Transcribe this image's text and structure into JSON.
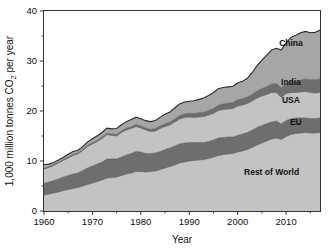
{
  "chart_data": {
    "type": "area",
    "stacked": true,
    "title": "",
    "subtitle": "",
    "xlabel": "Year",
    "ylabel": "1,000 million tonnes CO₂ per year",
    "xlim": [
      1960,
      2017
    ],
    "ylim": [
      0,
      40
    ],
    "xticks": [
      1960,
      1970,
      1980,
      1990,
      2000,
      2010
    ],
    "xtick_labels": [
      "1960",
      "1970",
      "1980",
      "1990",
      "2000",
      "2010"
    ],
    "xminor_ticks": [
      1965,
      1975,
      1985,
      1995,
      2005,
      2015
    ],
    "yticks": [
      0,
      10,
      20,
      30,
      40
    ],
    "ytick_labels": [
      "0",
      "10",
      "20",
      "30",
      "40"
    ],
    "yminor_ticks": [
      5,
      15,
      25,
      35
    ],
    "grid": false,
    "legend_position": "inline-right",
    "x": [
      1960,
      1961,
      1962,
      1963,
      1964,
      1965,
      1966,
      1967,
      1968,
      1969,
      1970,
      1971,
      1972,
      1973,
      1974,
      1975,
      1976,
      1977,
      1978,
      1979,
      1980,
      1981,
      1982,
      1983,
      1984,
      1985,
      1986,
      1987,
      1988,
      1989,
      1990,
      1991,
      1992,
      1993,
      1994,
      1995,
      1996,
      1997,
      1998,
      1999,
      2000,
      2001,
      2002,
      2003,
      2004,
      2005,
      2006,
      2007,
      2008,
      2009,
      2010,
      2011,
      2012,
      2013,
      2014,
      2015,
      2016,
      2017
    ],
    "series": [
      {
        "name": "Rest of World",
        "color": "#c3c3c3",
        "label_color": "#1a1a1a",
        "values": [
          3.2,
          3.4,
          3.6,
          3.8,
          4.1,
          4.3,
          4.5,
          4.7,
          5.0,
          5.3,
          5.6,
          5.9,
          6.2,
          6.6,
          6.7,
          6.8,
          7.1,
          7.4,
          7.6,
          7.9,
          7.9,
          7.8,
          7.9,
          8.0,
          8.3,
          8.6,
          8.9,
          9.2,
          9.6,
          9.8,
          10.0,
          10.1,
          10.2,
          10.3,
          10.5,
          10.8,
          11.1,
          11.3,
          11.4,
          11.5,
          11.8,
          12.0,
          12.3,
          12.7,
          13.2,
          13.6,
          14.0,
          14.4,
          14.6,
          14.3,
          14.9,
          15.3,
          15.5,
          15.6,
          15.7,
          15.6,
          15.6,
          15.7
        ]
      },
      {
        "name": "EU",
        "color": "#6e6e6e",
        "label_color": "#111111",
        "values": [
          2.3,
          2.4,
          2.5,
          2.6,
          2.7,
          2.8,
          2.9,
          2.9,
          3.1,
          3.3,
          3.4,
          3.5,
          3.6,
          3.8,
          3.7,
          3.6,
          3.7,
          3.8,
          3.9,
          4.0,
          3.9,
          3.7,
          3.6,
          3.6,
          3.6,
          3.7,
          3.7,
          3.8,
          3.8,
          3.8,
          3.7,
          3.6,
          3.5,
          3.4,
          3.4,
          3.4,
          3.5,
          3.4,
          3.4,
          3.3,
          3.3,
          3.4,
          3.4,
          3.5,
          3.5,
          3.5,
          3.5,
          3.4,
          3.4,
          3.1,
          3.2,
          3.1,
          3.1,
          3.0,
          2.9,
          2.9,
          2.9,
          2.9
        ]
      },
      {
        "name": "USA",
        "color": "#c3c3c3",
        "label_color": "#1a1a1a",
        "values": [
          2.9,
          2.9,
          3.0,
          3.2,
          3.3,
          3.5,
          3.7,
          3.8,
          4.0,
          4.3,
          4.4,
          4.5,
          4.7,
          4.9,
          4.7,
          4.6,
          4.9,
          5.0,
          5.0,
          5.0,
          4.8,
          4.7,
          4.4,
          4.4,
          4.6,
          4.6,
          4.6,
          4.8,
          5.0,
          5.1,
          5.1,
          5.0,
          5.1,
          5.2,
          5.3,
          5.3,
          5.5,
          5.6,
          5.6,
          5.7,
          5.9,
          5.8,
          5.8,
          5.8,
          5.9,
          5.9,
          5.8,
          5.9,
          5.7,
          5.3,
          5.4,
          5.3,
          5.1,
          5.2,
          5.3,
          5.2,
          5.1,
          5.1
        ]
      },
      {
        "name": "India",
        "color": "#6e6e6e",
        "label_color": "#111111",
        "values": [
          0.12,
          0.13,
          0.15,
          0.16,
          0.17,
          0.18,
          0.19,
          0.2,
          0.21,
          0.22,
          0.23,
          0.24,
          0.26,
          0.27,
          0.28,
          0.3,
          0.32,
          0.34,
          0.35,
          0.37,
          0.38,
          0.41,
          0.43,
          0.46,
          0.49,
          0.53,
          0.57,
          0.61,
          0.66,
          0.7,
          0.74,
          0.79,
          0.84,
          0.87,
          0.92,
          0.99,
          1.05,
          1.1,
          1.14,
          1.2,
          1.23,
          1.25,
          1.29,
          1.33,
          1.41,
          1.48,
          1.57,
          1.69,
          1.8,
          1.94,
          2.01,
          2.13,
          2.27,
          2.34,
          2.52,
          2.56,
          2.62,
          2.7
        ]
      },
      {
        "name": "China",
        "color": "#a6a6a6",
        "label_color": "#1a1a1a",
        "values": [
          0.78,
          0.55,
          0.44,
          0.46,
          0.5,
          0.55,
          0.62,
          0.54,
          0.57,
          0.7,
          0.82,
          0.9,
          0.95,
          1.0,
          1.05,
          1.2,
          1.22,
          1.33,
          1.46,
          1.5,
          1.48,
          1.46,
          1.55,
          1.65,
          1.78,
          1.93,
          2.03,
          2.18,
          2.33,
          2.4,
          2.42,
          2.55,
          2.68,
          2.83,
          2.99,
          3.2,
          3.32,
          3.3,
          3.28,
          3.25,
          3.35,
          3.48,
          3.76,
          4.38,
          5.05,
          5.7,
          6.3,
          6.8,
          7.03,
          7.55,
          8.1,
          8.9,
          9.2,
          9.5,
          9.5,
          9.4,
          9.5,
          9.8
        ]
      }
    ],
    "annotations": [
      {
        "text": "China",
        "x": 2011,
        "y": 33.0
      },
      {
        "text": "India",
        "x": 2011,
        "y": 25.2
      },
      {
        "text": "USA",
        "x": 2011,
        "y": 21.6
      },
      {
        "text": "EU",
        "x": 2012,
        "y": 17.2
      },
      {
        "text": "Rest of World",
        "x": 2007,
        "y": 7.2
      }
    ]
  },
  "axes": {
    "frame_color": "#333333",
    "tick_color": "#333333"
  }
}
